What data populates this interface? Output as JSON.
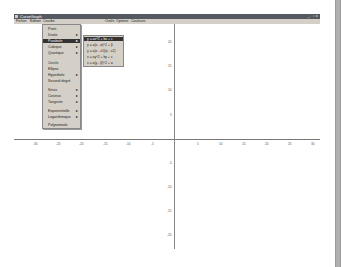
{
  "window": {
    "title": "CurveGraph",
    "controls": "_ □ x"
  },
  "menubar": {
    "items": [
      "Fichier",
      "Edition",
      "Courbe",
      "Outils",
      "Options",
      "Couleurs"
    ]
  },
  "courbe_menu": {
    "items": [
      {
        "label": "Point",
        "submenu": false
      },
      {
        "label": "Droite",
        "submenu": true
      },
      {
        "label": "Parabole",
        "submenu": true,
        "selected": true
      },
      {
        "label": "Cubique",
        "submenu": true
      },
      {
        "label": "Quartique",
        "submenu": true
      },
      {
        "label": "Cercle",
        "submenu": false
      },
      {
        "label": "Ellipse",
        "submenu": false
      },
      {
        "label": "Hyperbole",
        "submenu": true
      },
      {
        "label": "Second degré",
        "submenu": false
      },
      {
        "label": "Sinus",
        "submenu": true
      },
      {
        "label": "Cosinus",
        "submenu": true
      },
      {
        "label": "Tangente",
        "submenu": true
      },
      {
        "label": "Exponentielle",
        "submenu": true
      },
      {
        "label": "Logarithmique",
        "submenu": true
      },
      {
        "label": "Polynomiale",
        "submenu": false
      }
    ]
  },
  "parabole_submenu": {
    "items": [
      {
        "label": "y = ax^2 + bx + c",
        "selected": true
      },
      {
        "label": "y = a(x - α)^2 + β"
      },
      {
        "label": "y = a(x - x1)(x - x2)"
      },
      {
        "label": "x = ay^2 + by + c"
      },
      {
        "label": "x = a(y - β)^2 + α"
      }
    ]
  },
  "graph": {
    "x_ticks": [
      "-30",
      "-25",
      "-20",
      "-15",
      "-10",
      "-5",
      "5",
      "10",
      "15",
      "20",
      "25",
      "30"
    ],
    "y_ticks_pos": [
      "20",
      "15",
      "10",
      "5"
    ],
    "y_ticks_neg": [
      "-5",
      "-10",
      "-15",
      "-20"
    ],
    "x_range": [
      -30,
      30
    ],
    "y_range": [
      -20,
      20
    ]
  }
}
